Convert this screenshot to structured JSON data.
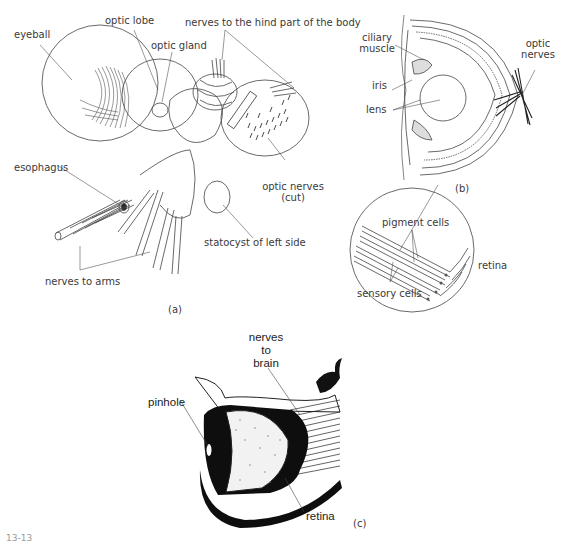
{
  "figure": {
    "panel_a": {
      "caption": "(a)",
      "labels": {
        "eyeball": "eyeball",
        "optic_lobe": "optic lobe",
        "optic_gland": "optic gland",
        "nerves_hind": "nerves to the hind part of the body",
        "esophagus": "esophagus",
        "optic_nerves_cut_1": "optic nerves",
        "optic_nerves_cut_2": "(cut)",
        "statocyst": "statocyst of left side",
        "nerves_to_arms": "nerves to arms"
      }
    },
    "panel_b": {
      "caption": "(b)",
      "labels": {
        "ciliary_1": "ciliary",
        "ciliary_2": "muscle",
        "iris": "iris",
        "lens": "lens",
        "optic_nerves_1": "optic",
        "optic_nerves_2": "nerves",
        "pigment_cells": "pigment cells",
        "sensory_cells": "sensory cells",
        "retina": "retina"
      }
    },
    "panel_c": {
      "caption": "(c)",
      "labels": {
        "nerves_1": "nerves",
        "nerves_2": "to",
        "nerves_3": "brain",
        "pinhole": "pinhole",
        "retina": "retina"
      }
    },
    "figure_number": "13-13"
  }
}
